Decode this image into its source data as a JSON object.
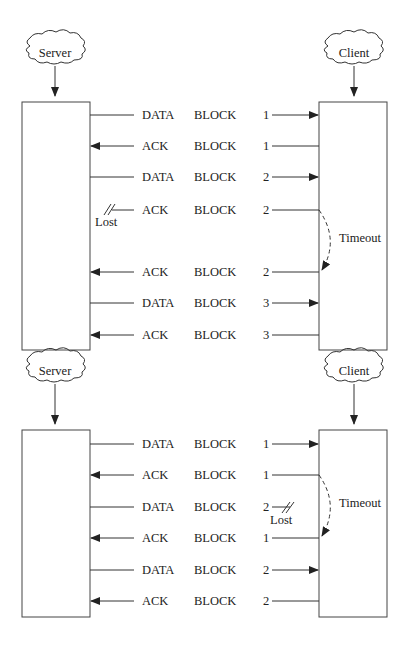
{
  "diagram": {
    "sections": [
      {
        "name": "normal-ack-loss",
        "server_label": "Server",
        "client_label": "Client",
        "messages": [
          {
            "type": "DATA",
            "word": "BLOCK",
            "num": "1",
            "dir": "to-client"
          },
          {
            "type": "ACK",
            "word": "BLOCK",
            "num": "1",
            "dir": "to-server"
          },
          {
            "type": "DATA",
            "word": "BLOCK",
            "num": "2",
            "dir": "to-client"
          },
          {
            "type": "ACK",
            "word": "BLOCK",
            "num": "2",
            "dir": "to-server",
            "lost": true
          },
          {
            "type": "ACK",
            "word": "BLOCK",
            "num": "2",
            "dir": "to-server"
          },
          {
            "type": "DATA",
            "word": "BLOCK",
            "num": "3",
            "dir": "to-client"
          },
          {
            "type": "ACK",
            "word": "BLOCK",
            "num": "3",
            "dir": "to-server"
          }
        ],
        "lost_label": "Lost",
        "timeout_label": "Timeout"
      },
      {
        "name": "data-loss",
        "server_label": "Server",
        "client_label": "Client",
        "messages": [
          {
            "type": "DATA",
            "word": "BLOCK",
            "num": "1",
            "dir": "to-client"
          },
          {
            "type": "ACK",
            "word": "BLOCK",
            "num": "1",
            "dir": "to-server"
          },
          {
            "type": "DATA",
            "word": "BLOCK",
            "num": "2",
            "dir": "to-client",
            "lost": true
          },
          {
            "type": "ACK",
            "word": "BLOCK",
            "num": "1",
            "dir": "to-server"
          },
          {
            "type": "DATA",
            "word": "BLOCK",
            "num": "2",
            "dir": "to-client"
          },
          {
            "type": "ACK",
            "word": "BLOCK",
            "num": "2",
            "dir": "to-server"
          }
        ],
        "lost_label": "Lost",
        "timeout_label": "Timeout"
      }
    ]
  }
}
